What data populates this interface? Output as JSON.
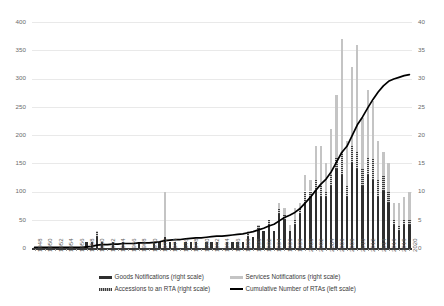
{
  "chart_data": {
    "type": "bar",
    "title": "",
    "subtitle": "",
    "xlabel": "",
    "ylabel": "",
    "grid": true,
    "legend_position": "bottom",
    "stacked": true,
    "left_axis": {
      "label": "Cumulative Number of RTAs (left scale)",
      "ticks": [
        0,
        50,
        100,
        150,
        200,
        250,
        300,
        350,
        400
      ],
      "ylim": [
        0,
        400
      ]
    },
    "right_axis": {
      "label": "Notifications / Accessions (right scale)",
      "ticks": [
        0,
        5,
        10,
        15,
        20,
        25,
        30,
        35,
        40
      ],
      "ylim": [
        0,
        40
      ]
    },
    "x": [
      1948,
      1949,
      1950,
      1951,
      1952,
      1953,
      1954,
      1955,
      1956,
      1957,
      1958,
      1959,
      1960,
      1961,
      1962,
      1963,
      1964,
      1965,
      1966,
      1967,
      1968,
      1969,
      1970,
      1971,
      1972,
      1973,
      1974,
      1975,
      1976,
      1977,
      1978,
      1979,
      1980,
      1981,
      1982,
      1983,
      1984,
      1985,
      1986,
      1987,
      1988,
      1989,
      1990,
      1991,
      1992,
      1993,
      1994,
      1995,
      1996,
      1997,
      1998,
      1999,
      2000,
      2001,
      2002,
      2003,
      2004,
      2005,
      2006,
      2007,
      2008,
      2009,
      2010,
      2011,
      2012,
      2013,
      2014,
      2015,
      2016,
      2017,
      2018,
      2019,
      2020
    ],
    "xtick_labels": [
      "1948",
      "1950",
      "1952",
      "1954",
      "1956",
      "1958",
      "1960",
      "1962",
      "1964",
      "1966",
      "1968",
      "1970",
      "1972",
      "1974",
      "1976",
      "1978",
      "1980",
      "1982",
      "1984",
      "1986",
      "1988",
      "1990",
      "1992",
      "1994",
      "1996",
      "1998",
      "2000",
      "2002",
      "2004",
      "2006",
      "2008",
      "2010",
      "2012",
      "2014",
      "2016",
      "2018",
      "2020"
    ],
    "series": [
      {
        "name": "Goods Notifications (right scale)",
        "axis": "right",
        "color": "#2f2f2f",
        "type": "bar-stack",
        "values": [
          0,
          0,
          0,
          0,
          0,
          0,
          0,
          0,
          0,
          0,
          1,
          1,
          2,
          1,
          0,
          1,
          0,
          1,
          0,
          0,
          1,
          0,
          0,
          1,
          1,
          2,
          1,
          1,
          0,
          1,
          1,
          1,
          0,
          1,
          1,
          1,
          0,
          1,
          1,
          1,
          1,
          2,
          2,
          3,
          3,
          4,
          3,
          6,
          5,
          3,
          4,
          6,
          8,
          9,
          10,
          9,
          9,
          11,
          14,
          13,
          9,
          15,
          14,
          11,
          13,
          12,
          9,
          10,
          8,
          4,
          3,
          4,
          4
        ]
      },
      {
        "name": "Accessions to an RTA (right scale)",
        "axis": "right",
        "color": "#3d3d3d",
        "type": "bar-stack",
        "values": [
          0,
          0,
          0,
          0,
          0,
          0,
          0,
          0,
          0,
          0,
          0,
          0,
          1,
          0,
          0,
          0,
          0,
          0,
          0,
          0,
          0,
          0,
          0,
          0,
          0,
          0,
          0,
          0,
          0,
          0,
          0,
          0,
          0,
          0,
          0,
          0,
          0,
          0,
          0,
          0,
          0,
          1,
          0,
          1,
          0,
          1,
          0,
          1,
          1,
          0,
          1,
          1,
          2,
          1,
          2,
          2,
          1,
          2,
          2,
          4,
          2,
          3,
          3,
          3,
          3,
          4,
          3,
          3,
          2,
          1,
          1,
          1,
          1
        ]
      },
      {
        "name": "Services Notifications (right scale)",
        "axis": "right",
        "color": "#c4c4c4",
        "type": "bar-stack",
        "values": [
          0,
          0,
          0,
          0,
          0,
          0,
          0,
          0,
          0,
          0,
          0,
          0,
          0,
          0,
          0,
          0,
          0,
          0,
          0,
          0,
          0,
          0,
          0,
          0,
          0,
          8,
          0,
          0,
          0,
          0,
          0,
          0,
          0,
          0,
          0,
          0,
          0,
          0,
          0,
          0,
          0,
          0,
          0,
          0,
          0,
          0,
          0,
          1,
          1,
          1,
          2,
          1,
          3,
          2,
          6,
          7,
          5,
          8,
          11,
          20,
          8,
          14,
          19,
          9,
          12,
          10,
          7,
          4,
          5,
          3,
          4,
          4,
          5
        ]
      },
      {
        "name": "Cumulative Number of RTAs  (left scale)",
        "axis": "left",
        "color": "#000000",
        "type": "line",
        "values": [
          1,
          1,
          1,
          1,
          1,
          1,
          1,
          1,
          1,
          1,
          2,
          3,
          5,
          6,
          6,
          7,
          7,
          8,
          8,
          8,
          9,
          9,
          9,
          10,
          11,
          13,
          14,
          15,
          15,
          16,
          17,
          18,
          18,
          19,
          20,
          21,
          21,
          22,
          23,
          24,
          25,
          27,
          29,
          32,
          35,
          39,
          42,
          48,
          54,
          58,
          63,
          70,
          80,
          90,
          102,
          113,
          122,
          135,
          152,
          169,
          180,
          199,
          218,
          232,
          248,
          263,
          276,
          287,
          295,
          299,
          302,
          305,
          307
        ]
      }
    ],
    "legend": [
      {
        "id": "goods",
        "label": "Goods Notifications (right scale)",
        "swatch": "bar",
        "color": "#2f2f2f"
      },
      {
        "id": "services",
        "label": "Services Notifications (right scale)",
        "swatch": "bar",
        "color": "#c4c4c4"
      },
      {
        "id": "accessions",
        "label": "Accessions to an RTA (right scale)",
        "swatch": "hatch",
        "color": "#3d3d3d"
      },
      {
        "id": "cumulative",
        "label": "Cumulative Number of RTAs  (left scale)",
        "swatch": "line",
        "color": "#000000"
      }
    ]
  }
}
